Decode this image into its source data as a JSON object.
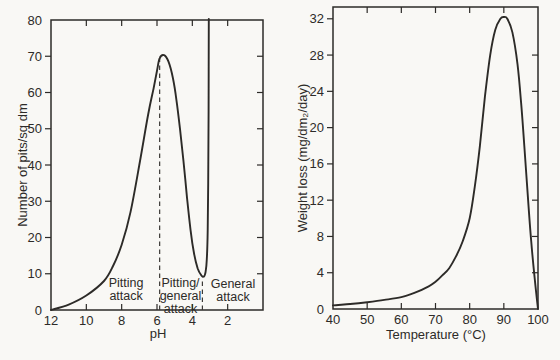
{
  "style": {
    "ink": "#2d2b28",
    "paper": "#f9f8f5"
  },
  "chart_data": [
    {
      "id": "ph-pitting-chart",
      "type": "line",
      "title": "",
      "xlabel": "pH",
      "ylabel": "Number of pits/sq dm",
      "x_axis_reversed": true,
      "xlim": [
        12,
        0
      ],
      "ylim": [
        0,
        80
      ],
      "x_tick_labels": [
        12,
        10,
        8,
        6,
        4,
        2
      ],
      "y_tick_labels": [
        0,
        10,
        20,
        30,
        40,
        50,
        60,
        70,
        80
      ],
      "grid": false,
      "legend": false,
      "series": [
        {
          "name": "number-of-pits-curve",
          "points": [
            [
              12,
              0
            ],
            [
              11,
              1.5
            ],
            [
              10,
              4
            ],
            [
              9,
              8
            ],
            [
              8.5,
              12
            ],
            [
              8,
              18
            ],
            [
              7.5,
              27
            ],
            [
              7,
              40
            ],
            [
              6.5,
              54
            ],
            [
              6.2,
              61
            ],
            [
              6,
              66
            ],
            [
              5.85,
              69.5
            ],
            [
              5.6,
              70.3
            ],
            [
              5.35,
              68.5
            ],
            [
              5.1,
              64
            ],
            [
              4.9,
              58
            ],
            [
              4.7,
              50
            ],
            [
              4.5,
              41
            ],
            [
              4.3,
              31
            ],
            [
              4.1,
              22
            ],
            [
              3.9,
              15.5
            ],
            [
              3.7,
              11.5
            ],
            [
              3.5,
              9.6
            ],
            [
              3.35,
              9.2
            ],
            [
              3.25,
              10.5
            ],
            [
              3.18,
              14
            ],
            [
              3.13,
              22
            ],
            [
              3.1,
              35
            ],
            [
              3.08,
              55
            ],
            [
              3.07,
              80.3
            ]
          ]
        }
      ],
      "dashed_guides": [
        {
          "x": 5.85,
          "from_value": 0,
          "to_value": 69.5
        },
        {
          "x": 3.43,
          "from_value": 0,
          "to_value": 8.8
        }
      ],
      "annotations": [
        {
          "name": "pitting-attack-label",
          "lines": [
            "Pitting",
            "attack"
          ],
          "x": 7.75,
          "value": 5.9
        },
        {
          "name": "pitting-general-attack-label",
          "lines": [
            "Pitting/",
            "general",
            "attack"
          ],
          "x": 4.67,
          "value": 3.9
        },
        {
          "name": "general-attack-label",
          "lines": [
            "General",
            "attack"
          ],
          "x": 1.7,
          "value": 5.5
        }
      ]
    },
    {
      "id": "temperature-weight-loss-chart",
      "type": "line",
      "title": "",
      "xlabel": "Temperature (°C)",
      "ylabel": "Weight loss (mg/dm₂/day)",
      "x_axis_reversed": false,
      "xlim": [
        40,
        100
      ],
      "ylim": [
        0,
        33.3
      ],
      "x_tick_labels": [
        40,
        50,
        60,
        70,
        80,
        90,
        100
      ],
      "y_tick_labels": [
        0,
        4,
        8,
        12,
        16,
        20,
        24,
        28,
        32
      ],
      "grid": false,
      "legend": false,
      "series": [
        {
          "name": "weight-loss-curve",
          "points": [
            [
              40,
              0.4
            ],
            [
              45,
              0.55
            ],
            [
              50,
              0.75
            ],
            [
              55,
              1.0
            ],
            [
              60,
              1.3
            ],
            [
              64,
              1.8
            ],
            [
              68,
              2.5
            ],
            [
              70,
              3.0
            ],
            [
              72,
              3.7
            ],
            [
              74,
              4.5
            ],
            [
              76,
              5.8
            ],
            [
              78,
              7.5
            ],
            [
              80,
              10
            ],
            [
              81.5,
              13.5
            ],
            [
              83,
              18
            ],
            [
              84.5,
              23.5
            ],
            [
              86,
              28
            ],
            [
              87.5,
              30.8
            ],
            [
              89,
              32.0
            ],
            [
              90,
              32.2
            ],
            [
              91,
              32.0
            ],
            [
              92.5,
              30.5
            ],
            [
              94,
              27
            ],
            [
              95,
              23
            ],
            [
              96,
              18
            ],
            [
              97,
              12.5
            ],
            [
              98,
              7.5
            ],
            [
              99,
              3.5
            ],
            [
              100,
              0
            ]
          ]
        }
      ],
      "dashed_guides": [],
      "annotations": []
    }
  ]
}
